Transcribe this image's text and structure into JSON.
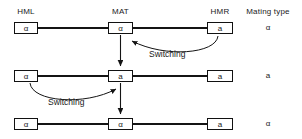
{
  "headers": {
    "hml": "HML",
    "mat": "MAT",
    "hmr": "HMR",
    "mating_type": "Mating type"
  },
  "rows": [
    {
      "hml_allele": "α",
      "mat_allele": "α",
      "hmr_allele": "a",
      "mating_type": "α"
    },
    {
      "hml_allele": "α",
      "mat_allele": "a",
      "hmr_allele": "a",
      "mating_type": "a"
    },
    {
      "hml_allele": "α",
      "mat_allele": "α",
      "hmr_allele": "a",
      "mating_type": "α"
    }
  ],
  "annotations": {
    "switching_1": "Switching",
    "switching_2": "Switching"
  },
  "colors": {
    "line": "#141414",
    "text": "#1a1a1a",
    "background": "#ffffff"
  }
}
